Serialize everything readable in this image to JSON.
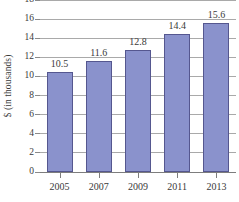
{
  "chart_data": {
    "type": "bar",
    "title": "",
    "subtitle": "",
    "xlabel": "",
    "ylabel": "$ (in thousands)",
    "categories": [
      "2005",
      "2007",
      "2009",
      "2011",
      "2013"
    ],
    "values": [
      10.5,
      11.6,
      12.8,
      14.4,
      15.6
    ],
    "value_labels": [
      "10.5",
      "11.6",
      "12.8",
      "14.4",
      "15.6"
    ],
    "ylim": [
      0,
      18
    ],
    "y_ticks": [
      0,
      2,
      4,
      6,
      8,
      10,
      12,
      14,
      16,
      18
    ],
    "y_tick_labels": [
      "0",
      "2",
      "4",
      "6",
      "8",
      "10",
      "12",
      "14",
      "16",
      "18"
    ],
    "grid": true,
    "legend": null,
    "legend_position": "none",
    "annotations": [],
    "colors": {
      "bar_fill": "#8a92cc",
      "bar_stroke": "#55578f",
      "gridline": "#a9a9a9",
      "axis_line": "#7d7d7d",
      "text": "#3a3a3a",
      "background": "#ffffff"
    }
  }
}
